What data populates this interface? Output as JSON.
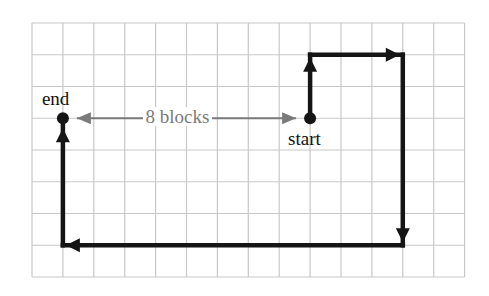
{
  "diagram": {
    "title": "",
    "grid": {
      "columns": 14,
      "rows": 8,
      "origin_px": [
        32,
        23
      ],
      "cell_w": 30.9,
      "cell_h": 31.75,
      "line_color": "#c8c8c8"
    },
    "points": {
      "start": {
        "label": "start",
        "grid": [
          9,
          3
        ]
      },
      "end": {
        "label": "end",
        "grid": [
          1,
          3
        ]
      }
    },
    "path": {
      "color": "#151515",
      "segments": [
        {
          "from": [
            9,
            3
          ],
          "to": [
            9,
            1
          ],
          "direction": "up",
          "blocks": 2
        },
        {
          "from": [
            9,
            1
          ],
          "to": [
            12,
            1
          ],
          "direction": "right",
          "blocks": 3
        },
        {
          "from": [
            12,
            1
          ],
          "to": [
            12,
            7
          ],
          "direction": "down",
          "blocks": 6
        },
        {
          "from": [
            12,
            7
          ],
          "to": [
            1,
            7
          ],
          "direction": "left",
          "blocks": 11
        },
        {
          "from": [
            1,
            7
          ],
          "to": [
            1,
            3
          ],
          "direction": "up",
          "blocks": 4
        }
      ]
    },
    "distance_annotation": {
      "text": "8 blocks",
      "color": "#7a7a7a",
      "from": [
        1,
        3
      ],
      "to": [
        9,
        3
      ]
    }
  }
}
